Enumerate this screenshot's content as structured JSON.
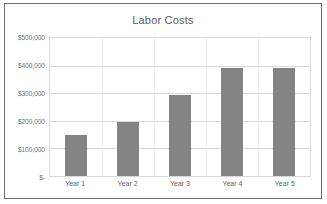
{
  "chart_data": {
    "type": "bar",
    "title": "Labor Costs",
    "xlabel": "",
    "ylabel": "",
    "categories": [
      "Year 1",
      "Year 2",
      "Year 3",
      "Year 4",
      "Year 5"
    ],
    "values": [
      150000,
      195000,
      293000,
      393000,
      390000
    ],
    "series": [
      {
        "name": "Labor Costs",
        "values": [
          150000,
          195000,
          293000,
          393000,
          390000
        ]
      }
    ],
    "ylim": [
      0,
      500000
    ],
    "y_ticks": [
      0,
      100000,
      200000,
      300000,
      400000,
      500000
    ],
    "y_tick_labels": [
      "$-",
      "$100,000",
      "$200,000",
      "$300,000",
      "$400,000",
      "$500,000"
    ],
    "grid": true,
    "legend": false,
    "legend_position": "none",
    "bar_color": "#848484",
    "plot_border_color": "#d8d8d8",
    "frame_border_color": "#6e6e6e",
    "title_color": "#5a5a5a",
    "tick_label_color": "#6d6d6d"
  }
}
